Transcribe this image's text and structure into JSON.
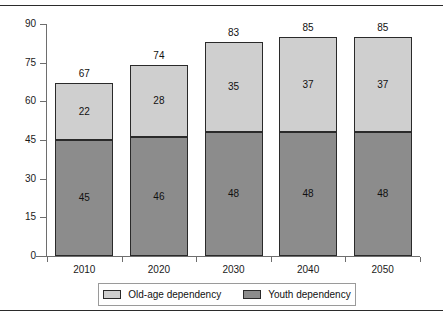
{
  "page": {
    "clipped_caption_above": "",
    "top_rule": "horizontal-rule",
    "bottom_rule": "horizontal-rule"
  },
  "chart_data": {
    "type": "bar",
    "subtype": "stacked-vertical",
    "title": "",
    "xlabel": "",
    "ylabel": "",
    "categories": [
      "2010",
      "2020",
      "2030",
      "2040",
      "2050"
    ],
    "series": [
      {
        "name": "Youth dependency",
        "color": "#8c8c8c",
        "values": [
          45,
          46,
          48,
          48,
          48
        ]
      },
      {
        "name": "Old-age dependency",
        "color": "#cfcfcf",
        "values": [
          22,
          28,
          35,
          37,
          37
        ]
      }
    ],
    "totals": [
      67,
      74,
      83,
      85,
      85
    ],
    "ylim": [
      0,
      90
    ],
    "yticks": [
      0,
      15,
      30,
      45,
      60,
      75,
      90
    ],
    "ytick_labels": [
      "0",
      "15",
      "30",
      "45",
      "60",
      "75",
      "90"
    ],
    "grid": false,
    "legend_position": "bottom",
    "data_labels": true
  },
  "legend": {
    "items": [
      {
        "label": "Old-age dependency",
        "swatch": "light-gray-swatch-icon"
      },
      {
        "label": "Youth dependency",
        "swatch": "dark-gray-swatch-icon"
      }
    ]
  }
}
